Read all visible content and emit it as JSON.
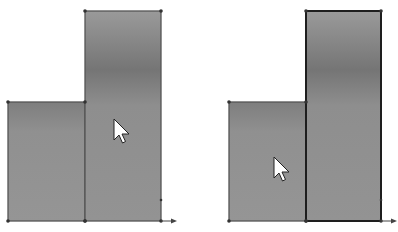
{
  "panels": [
    {
      "id": "left",
      "offset_x": 0,
      "shapes": [
        {
          "name": "short-rectangle",
          "x": 8,
          "y": 102,
          "w": 77,
          "h": 119,
          "selected": false
        },
        {
          "name": "tall-rectangle",
          "x": 85,
          "y": 11,
          "w": 76,
          "h": 210,
          "selected": false
        }
      ],
      "cursor": {
        "x": 114,
        "y": 119
      },
      "axis_arrow": {
        "x": 161,
        "y": 221
      }
    },
    {
      "id": "right",
      "offset_x": 0,
      "shapes": [
        {
          "name": "short-rectangle",
          "x": 229,
          "y": 102,
          "w": 77,
          "h": 119,
          "selected": false
        },
        {
          "name": "tall-rectangle",
          "x": 306,
          "y": 11,
          "w": 75,
          "h": 210,
          "selected": true
        }
      ],
      "cursor": {
        "x": 274,
        "y": 157
      },
      "axis_arrow": {
        "x": 381,
        "y": 221
      }
    }
  ],
  "colors": {
    "fill": "#8f8f8f",
    "fill_dark": "#767676",
    "edge": "#555555",
    "edge_selected": "#1e1e1e",
    "vertex": "#333333",
    "background": "#ffffff"
  }
}
